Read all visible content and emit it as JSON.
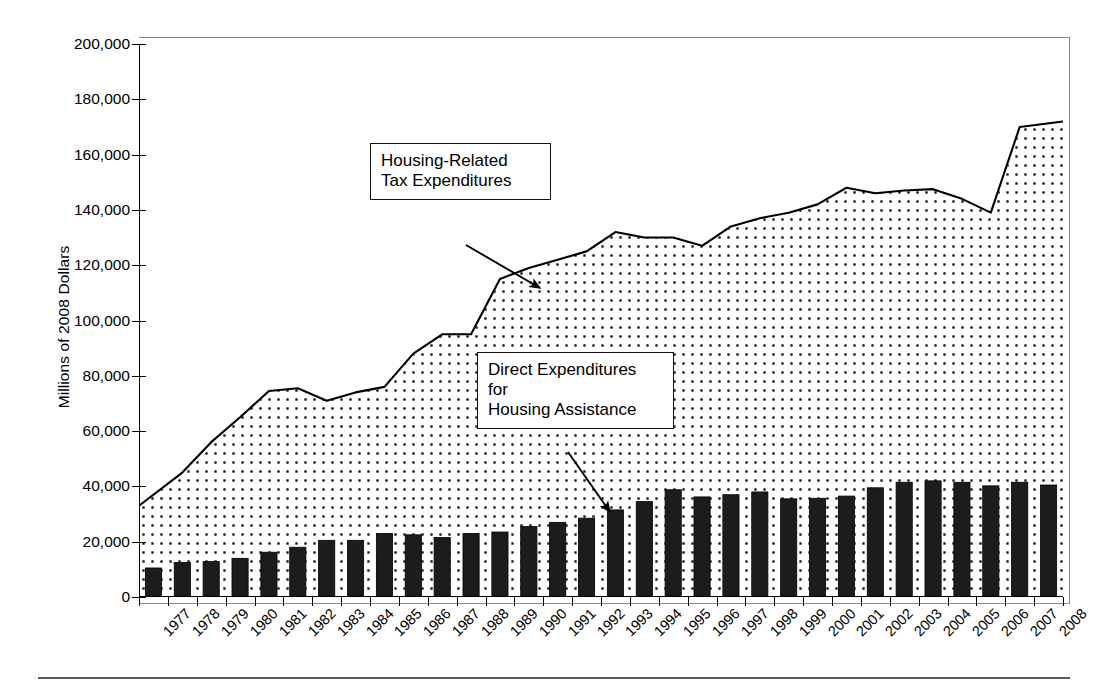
{
  "chart_data": {
    "type": "area",
    "title": "",
    "xlabel": "",
    "ylabel": "Millions of 2008 Dollars",
    "ylim": [
      0,
      200000
    ],
    "ytick_values": [
      0,
      20000,
      40000,
      60000,
      80000,
      100000,
      120000,
      140000,
      160000,
      180000,
      200000
    ],
    "ytick_labels": [
      "0",
      "20,000",
      "40,000",
      "60,000",
      "80,000",
      "100,000",
      "120,000",
      "140,000",
      "160,000",
      "180,000",
      "200,000"
    ],
    "grid": false,
    "legend": "none",
    "categories": [
      "1977",
      "1978",
      "1979",
      "1980",
      "1981",
      "1982",
      "1983",
      "1984",
      "1985",
      "1986",
      "1987",
      "1988",
      "1989",
      "1990",
      "1991",
      "1992",
      "1993",
      "1994",
      "1995",
      "1996",
      "1997",
      "1998",
      "1999",
      "2000",
      "2001",
      "2002",
      "2003",
      "2004",
      "2005",
      "2006",
      "2007",
      "2008"
    ],
    "series": [
      {
        "name": "Housing-Related Tax Expenditures",
        "render": "area-line",
        "fill": "dotted",
        "values": [
          33000,
          45000,
          56000,
          65000,
          74500,
          75500,
          71000,
          74000,
          76000,
          88000,
          95000,
          95000,
          115000,
          119000,
          122000,
          125000,
          132000,
          130000,
          130000,
          127000,
          134000,
          137000,
          139000,
          142000,
          148000,
          146000,
          147000,
          147500,
          144000,
          139000,
          170000,
          172000
        ]
      },
      {
        "name": "Direct Expenditures for Housing Assistance",
        "render": "bar",
        "values": [
          10500,
          12500,
          12800,
          14000,
          16200,
          18000,
          20500,
          20500,
          23000,
          22500,
          21500,
          23000,
          23500,
          25500,
          27000,
          28500,
          31500,
          34500,
          38800,
          36200,
          37000,
          38000,
          35500,
          35700,
          36500,
          39500,
          41500,
          42000,
          41500,
          40200,
          41500,
          40500
        ]
      }
    ],
    "annotations": [
      {
        "id": "tax-expenditures",
        "text": "Housing-Related\nTax Expenditures",
        "arrow_from": [
          466,
          245
        ],
        "arrow_to": [
          540,
          288
        ]
      },
      {
        "id": "direct-expenditures",
        "text": "Direct Expenditures\nfor\nHousing Assistance",
        "arrow_from": [
          568,
          452
        ],
        "arrow_to": [
          610,
          512
        ]
      }
    ]
  },
  "axes": {
    "y_title": "Millions of 2008 Dollars"
  },
  "annotations": {
    "tax_expenditures_label": "Housing-Related\nTax Expenditures",
    "direct_expenditures_label": "Direct Expenditures\nfor\nHousing Assistance"
  }
}
